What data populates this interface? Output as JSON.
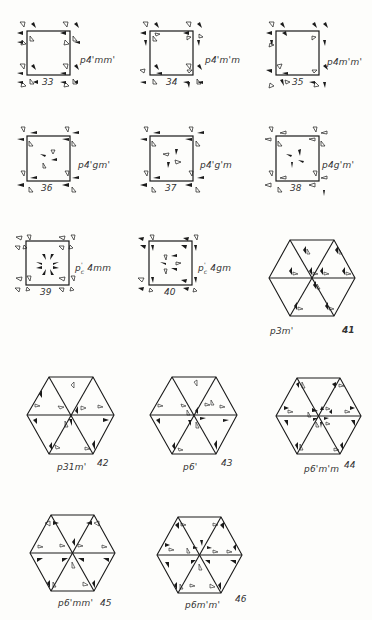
{
  "page": {
    "corner_mark": "p. 4"
  },
  "figures": [
    {
      "number": "33",
      "group": "p4'mm'",
      "shape": "square"
    },
    {
      "number": "34",
      "group": "p4'm'm",
      "shape": "square"
    },
    {
      "number": "35",
      "group": "p4m'm'",
      "shape": "square"
    },
    {
      "number": "36",
      "group": "p4'gm'",
      "shape": "square"
    },
    {
      "number": "37",
      "group": "p4'g'm",
      "shape": "square"
    },
    {
      "number": "38",
      "group": "p4g'm'",
      "shape": "square"
    },
    {
      "number": "39",
      "group": "p'c 4mm",
      "group_base": "p",
      "group_sup": "'",
      "group_sub": "c",
      "group_rest": " 4mm",
      "shape": "square"
    },
    {
      "number": "40",
      "group": "p'c 4gm",
      "group_base": "p",
      "group_sup": "'",
      "group_sub": "c",
      "group_rest": " 4gm",
      "shape": "square"
    },
    {
      "number": "41",
      "group": "p3m'",
      "shape": "hexagon"
    },
    {
      "number": "42",
      "group": "p31m'",
      "shape": "hexagon"
    },
    {
      "number": "43",
      "group": "p6'",
      "shape": "hexagon"
    },
    {
      "number": "44",
      "group": "p6'm'm",
      "shape": "hexagon"
    },
    {
      "number": "45",
      "group": "p6'mm'",
      "shape": "hexagon"
    },
    {
      "number": "46",
      "group": "p6m'm'",
      "shape": "hexagon"
    }
  ],
  "colors": {
    "ink": "#1a1a1a",
    "paper": "#fdfdfb"
  }
}
